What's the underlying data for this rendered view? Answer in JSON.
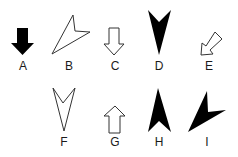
{
  "figures": [
    {
      "id": "A",
      "label": "A",
      "icon": "solid-down-block-arrow-icon"
    },
    {
      "id": "B",
      "label": "B",
      "icon": "outline-arrowhead-down-left-icon"
    },
    {
      "id": "C",
      "label": "C",
      "icon": "outline-down-block-arrow-icon"
    },
    {
      "id": "D",
      "label": "D",
      "icon": "solid-arrowhead-down-icon"
    },
    {
      "id": "E",
      "label": "E",
      "icon": "outline-block-arrow-down-left-icon"
    },
    {
      "id": "F",
      "label": "F",
      "icon": "outline-arrowhead-down-icon"
    },
    {
      "id": "G",
      "label": "G",
      "icon": "outline-up-block-arrow-icon"
    },
    {
      "id": "H",
      "label": "H",
      "icon": "solid-arrowhead-up-icon"
    },
    {
      "id": "I",
      "label": "I",
      "icon": "solid-arrowhead-down-left-icon"
    }
  ],
  "colors": {
    "fill": "#000000",
    "stroke": "#333333",
    "background": "#ffffff"
  }
}
